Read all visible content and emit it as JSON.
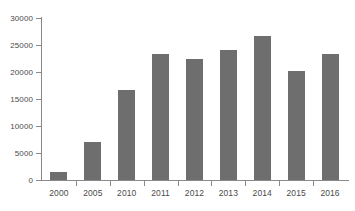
{
  "chart_data": {
    "type": "bar",
    "title": "",
    "subtitle": "",
    "xlabel": "",
    "ylabel": "",
    "categories": [
      "2000",
      "2005",
      "2010",
      "2011",
      "2012",
      "2013",
      "2014",
      "2015",
      "2016"
    ],
    "values": [
      1400,
      7100,
      16700,
      23300,
      22500,
      24000,
      26600,
      20200,
      23300
    ],
    "ylim": [
      0,
      30000
    ],
    "yticks": [
      0,
      5000,
      10000,
      15000,
      20000,
      25000,
      30000
    ],
    "ytick_labels": [
      "0",
      "5000",
      "10000",
      "15000",
      "20000",
      "25000",
      "30000"
    ],
    "grid": false,
    "legend": false,
    "legend_position": "none",
    "bar_color": "#6e6e6e",
    "axis_color": "#8a8a8a",
    "text_color": "#4a4a4a",
    "background_color": "#ffffff"
  }
}
